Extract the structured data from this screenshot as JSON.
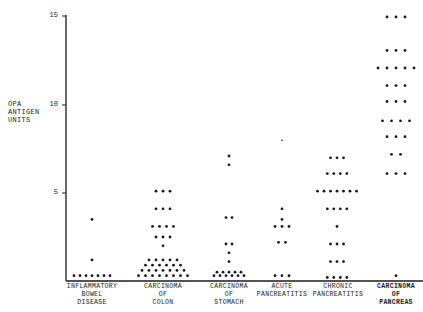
{
  "chart_data": {
    "type": "scatter",
    "title": "",
    "xlabel": "",
    "ylabel": "OPA ANTIGEN UNITS",
    "ylim": [
      0,
      15
    ],
    "yticks": [
      5,
      10,
      15
    ],
    "grid": false,
    "categories": [
      "INFLAMMATORY BOWEL DISEASE",
      "CARCINOMA OF COLON",
      "CARCINOMA OF STOMACH",
      "ACUTE PANCREATITIS",
      "CHRONIC PANCREATITIS",
      "CARCINOMA OF PANCREAS"
    ],
    "series": [
      {
        "name": "INFLAMMATORY BOWEL DISEASE",
        "rows": [
          [
            3.5,
            1
          ],
          [
            1.2,
            1
          ],
          [
            0.3,
            7
          ]
        ]
      },
      {
        "name": "CARCINOMA OF COLON",
        "rows": [
          [
            5.1,
            3
          ],
          [
            4.1,
            3
          ],
          [
            3.1,
            4
          ],
          [
            2.5,
            3
          ],
          [
            2.0,
            1
          ],
          [
            1.2,
            5
          ],
          [
            0.9,
            6
          ],
          [
            0.6,
            7
          ],
          [
            0.3,
            8
          ]
        ]
      },
      {
        "name": "CARCINOMA OF STOMACH",
        "rows": [
          [
            7.1,
            1
          ],
          [
            6.6,
            1
          ],
          [
            3.6,
            2
          ],
          [
            2.1,
            2
          ],
          [
            1.6,
            1
          ],
          [
            1.1,
            1
          ],
          [
            0.5,
            5
          ],
          [
            0.3,
            6
          ]
        ]
      },
      {
        "name": "ACUTE PANCREATITIS",
        "rows": [
          [
            8.0,
            1
          ],
          [
            4.1,
            1
          ],
          [
            3.5,
            1
          ],
          [
            3.1,
            3
          ],
          [
            2.2,
            2
          ],
          [
            0.3,
            3
          ]
        ]
      },
      {
        "name": "CHRONIC PANCREATITIS",
        "rows": [
          [
            7.0,
            3
          ],
          [
            6.1,
            4
          ],
          [
            5.1,
            7
          ],
          [
            4.1,
            4
          ],
          [
            3.1,
            1
          ],
          [
            2.1,
            3
          ],
          [
            1.1,
            3
          ],
          [
            0.2,
            4
          ]
        ]
      },
      {
        "name": "CARCINOMA OF PANCREAS",
        "rows": [
          [
            15.0,
            3
          ],
          [
            13.1,
            3
          ],
          [
            12.1,
            5
          ],
          [
            11.1,
            3
          ],
          [
            10.2,
            3
          ],
          [
            9.1,
            4
          ],
          [
            8.2,
            3
          ],
          [
            7.2,
            2
          ],
          [
            6.1,
            3
          ],
          [
            0.3,
            1
          ]
        ]
      }
    ],
    "note": "each row = [value, number of dots at that value]"
  },
  "labels": {
    "ylabel": "OPA\nANTIGEN\nUNITS",
    "ticks": [
      "15",
      "10",
      "5"
    ],
    "categories": [
      "INFLAMMATORY\nBOWEL\nDISEASE",
      "CARCINOMA\nOF\nCOLON",
      "CARCINOMA\nOF\nSTOMACH",
      "ACUTE\nPANCREATITIS",
      "CHRONIC\nPANCREATITIS",
      "CARCINOMA\nOF\nPANCREAS"
    ]
  },
  "layout": {
    "axis_x": 66,
    "y0": 281,
    "px_per_unit": 17.6,
    "centers": [
      92,
      163,
      229,
      282,
      337,
      396
    ],
    "spacing": [
      6,
      7,
      6,
      7,
      6.5,
      9
    ],
    "dot_color": "#1a1a1a"
  }
}
